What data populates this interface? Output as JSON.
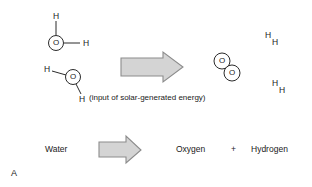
{
  "figure": {
    "panel_letter": "A",
    "background_color": "#ffffff",
    "text_color": "#1a1a1a"
  },
  "reactants": {
    "water_molecule_1": {
      "oxygen_label": "O",
      "hydrogen_top_label": "H",
      "hydrogen_right_label": "H"
    },
    "water_molecule_2": {
      "oxygen_label": "O",
      "hydrogen_left_label": "H",
      "hydrogen_bottom_label": "H"
    }
  },
  "energy_caption": "(input of solar-generated energy)",
  "products": {
    "oxygen_molecule": {
      "atom_1_label": "O",
      "atom_2_label": "O"
    },
    "hydrogen_molecule_1": {
      "atom_1_label": "H",
      "atom_2_label": "H"
    },
    "hydrogen_molecule_2": {
      "atom_1_label": "H",
      "atom_2_label": "H"
    }
  },
  "word_equation": {
    "reactant": "Water",
    "product_1": "Oxygen",
    "plus_sign": "+",
    "product_2": "Hydrogen"
  },
  "arrows": {
    "reaction_arrow_top": "reaction-arrow",
    "reaction_arrow_bottom": "reaction-arrow",
    "fill_color": "#d4d4d4",
    "stroke_color": "#8c8c8c"
  },
  "bonds": {
    "stroke_color": "#2b2b2b"
  }
}
